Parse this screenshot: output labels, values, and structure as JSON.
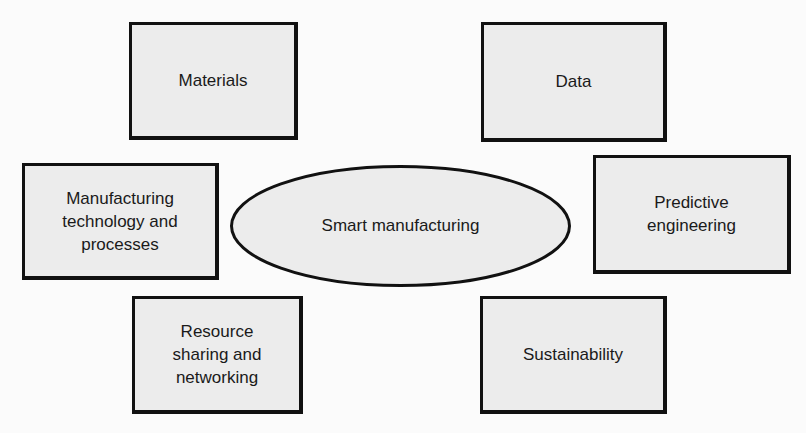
{
  "diagram": {
    "center": {
      "label": "Smart manufacturing"
    },
    "nodes": [
      {
        "id": "materials",
        "label": "Materials"
      },
      {
        "id": "data",
        "label": "Data"
      },
      {
        "id": "manufacturing",
        "label": "Manufacturing\ntechnology and\nprocesses"
      },
      {
        "id": "predictive",
        "label": "Predictive\nengineering"
      },
      {
        "id": "resource",
        "label": "Resource\nsharing and\nnetworking"
      },
      {
        "id": "sustainability",
        "label": "Sustainability"
      }
    ],
    "colors": {
      "fill": "#ececec",
      "stroke": "#111111",
      "background": "#fbfbfb"
    }
  }
}
